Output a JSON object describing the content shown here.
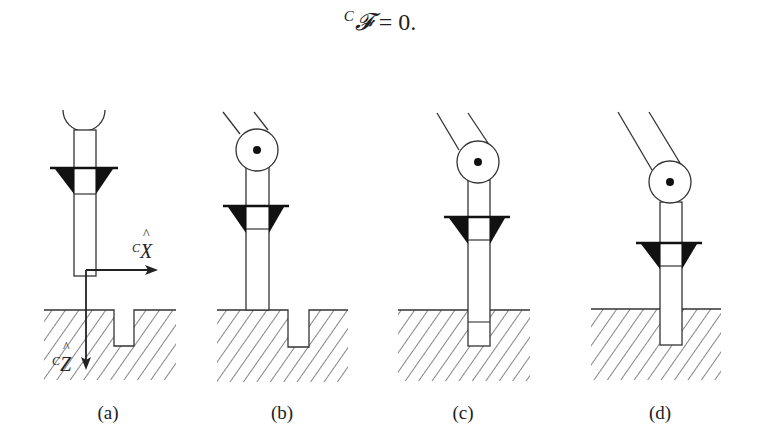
{
  "equation": {
    "frame_superscript": "C",
    "symbol": "𝓕",
    "rest": " = 0."
  },
  "panels": [
    {
      "id": "a",
      "caption": "(a)",
      "state": "peg above surface, straight gripper with open end"
    },
    {
      "id": "b",
      "caption": "(b)",
      "state": "peg touching surface beside hole"
    },
    {
      "id": "c",
      "caption": "(c)",
      "state": "peg partially inserted into hole"
    },
    {
      "id": "d",
      "caption": "(d)",
      "state": "peg fully inserted into hole"
    }
  ],
  "axes": {
    "x_label_prefix": "C",
    "x_label": "X",
    "x_hat": "^",
    "z_label_prefix": "C",
    "z_label": "Z",
    "z_hat": "^"
  },
  "colors": {
    "line": "#333333",
    "fill_dark": "#111111",
    "background": "#ffffff"
  }
}
